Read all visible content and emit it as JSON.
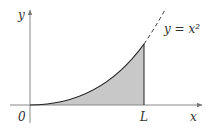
{
  "diagram": {
    "type": "area-under-curve",
    "curve_label": "y = x²",
    "curve_equation": "y = x^2",
    "axis_labels": {
      "x": "x",
      "y": "y"
    },
    "origin_label": "0",
    "bound_label": "L",
    "shaded_region": "area under y = x² from 0 to L",
    "colors": {
      "fill": "#c8c8c8",
      "axis": "#888888",
      "curve": "#222222"
    }
  }
}
